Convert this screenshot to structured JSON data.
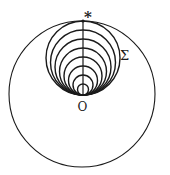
{
  "diagram": {
    "type": "nested-tangent-circles",
    "labels": {
      "star": "*",
      "sigma": "Σ",
      "origin": "O"
    },
    "outer_circle": {
      "cx": 82,
      "cy": 94,
      "r": 73
    },
    "tangent_point_bottom": {
      "x": 83,
      "y": 95
    },
    "top_point": {
      "x": 83,
      "y": 21
    },
    "inner_circles": [
      {
        "diameter": 74
      },
      {
        "diameter": 65
      },
      {
        "diameter": 56
      },
      {
        "diameter": 47
      },
      {
        "diameter": 38
      },
      {
        "diameter": 29
      },
      {
        "diameter": 20
      },
      {
        "diameter": 11
      }
    ],
    "colors": {
      "ink": "#1a1a1a",
      "background": "#ffffff"
    }
  }
}
